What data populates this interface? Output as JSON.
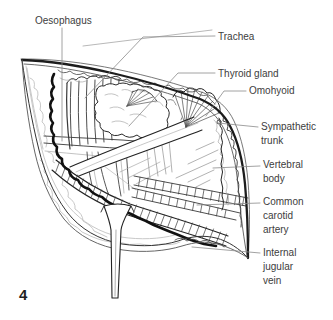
{
  "figure_number": "4",
  "labels": [
    {
      "text": "Oesophagus"
    },
    {
      "text": "Trachea"
    },
    {
      "text": "Thyroid gland"
    },
    {
      "text": "Omohyoid"
    },
    {
      "text": "Sympathetic trunk"
    },
    {
      "text": "Vertebral body"
    },
    {
      "text": "Common carotid artery"
    },
    {
      "text": "Internal jugular vein"
    }
  ],
  "colors": {
    "ink": "#1c1c1c",
    "mid_ink": "#444444",
    "light_detail": "#c2c2c2",
    "leader_line": "#8a8a8a",
    "label_text": "#3d3d3d",
    "background": "#ffffff"
  }
}
